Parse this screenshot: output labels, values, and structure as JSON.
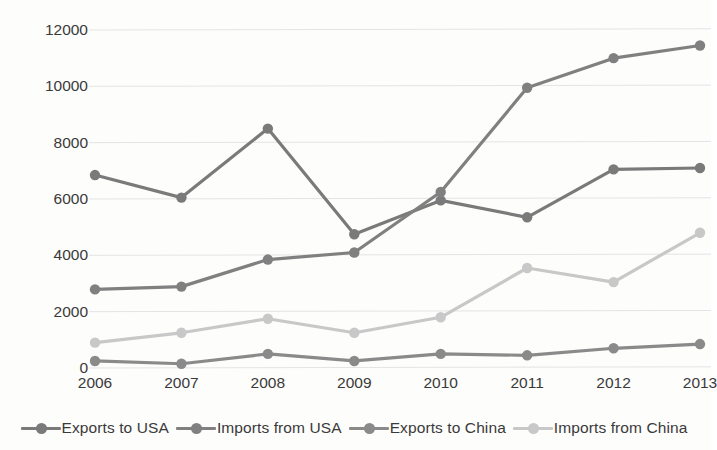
{
  "chart_data": {
    "type": "line",
    "title": "",
    "subtitle": "",
    "xlabel": "",
    "ylabel": "",
    "categories": [
      "2006",
      "2007",
      "2008",
      "2009",
      "2010",
      "2011",
      "2012",
      "2013"
    ],
    "ylim": [
      0,
      12000
    ],
    "xlim": [
      "2006",
      "2013"
    ],
    "yticks": [
      "0",
      "2000",
      "4000",
      "6000",
      "8000",
      "10000",
      "12000"
    ],
    "ytick_values": [
      0,
      2000,
      4000,
      6000,
      8000,
      10000,
      12000
    ],
    "grid": "horizontal",
    "legend_position": "bottom",
    "markers": "circle",
    "series": [
      {
        "name": "Exports to USA",
        "color": "#7a7a7a",
        "values": [
          6850,
          6050,
          8500,
          4750,
          5950,
          5350,
          7050,
          7100
        ]
      },
      {
        "name": "Imports from USA",
        "color": "#808080",
        "values": [
          2790,
          2890,
          3850,
          4100,
          6250,
          9950,
          11000,
          11450
        ]
      },
      {
        "name": "Exports to China",
        "color": "#8a8a8a",
        "values": [
          250,
          150,
          500,
          250,
          500,
          450,
          700,
          850
        ]
      },
      {
        "name": "Imports from China",
        "color": "#c8c8c8",
        "values": [
          900,
          1250,
          1750,
          1250,
          1800,
          3550,
          3050,
          4800
        ]
      }
    ]
  },
  "axis": {
    "gridline_color": "#e4e4e4"
  }
}
